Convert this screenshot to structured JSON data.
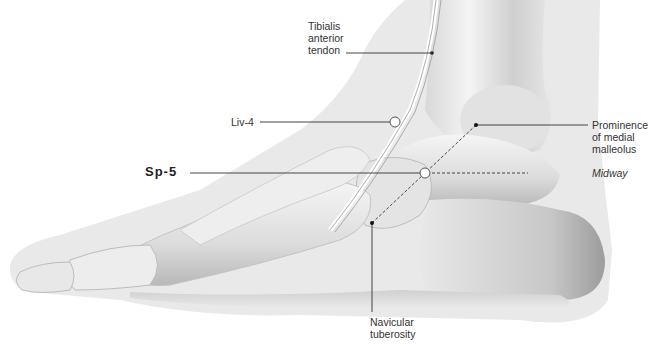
{
  "figure": {
    "colors": {
      "background": "#ffffff",
      "skin_silhouette": "#e9e9e9",
      "bone_light": "#f2f2f2",
      "bone_shadow": "#a8a8a8",
      "leader_line": "#444444",
      "point_marker_fill": "#ffffff",
      "point_marker_stroke": "#555555"
    }
  },
  "labels": {
    "tibialis": [
      "Tibialis",
      "anterior",
      "tendon"
    ],
    "liv4": "Liv-4",
    "sp5": "Sp-5",
    "prominence": [
      "Prominence",
      "of medial",
      "malleolus"
    ],
    "midway": "Midway",
    "navicular": [
      "Navicular",
      "tuberosity"
    ]
  },
  "points": [
    {
      "id": "Liv-4",
      "x": 395,
      "y": 122
    },
    {
      "id": "Sp-5",
      "x": 425,
      "y": 173
    }
  ],
  "landmarks": [
    {
      "id": "medial-malleolus-prominence",
      "x": 476,
      "y": 125
    },
    {
      "id": "navicular-tuberosity",
      "x": 372,
      "y": 223
    }
  ]
}
